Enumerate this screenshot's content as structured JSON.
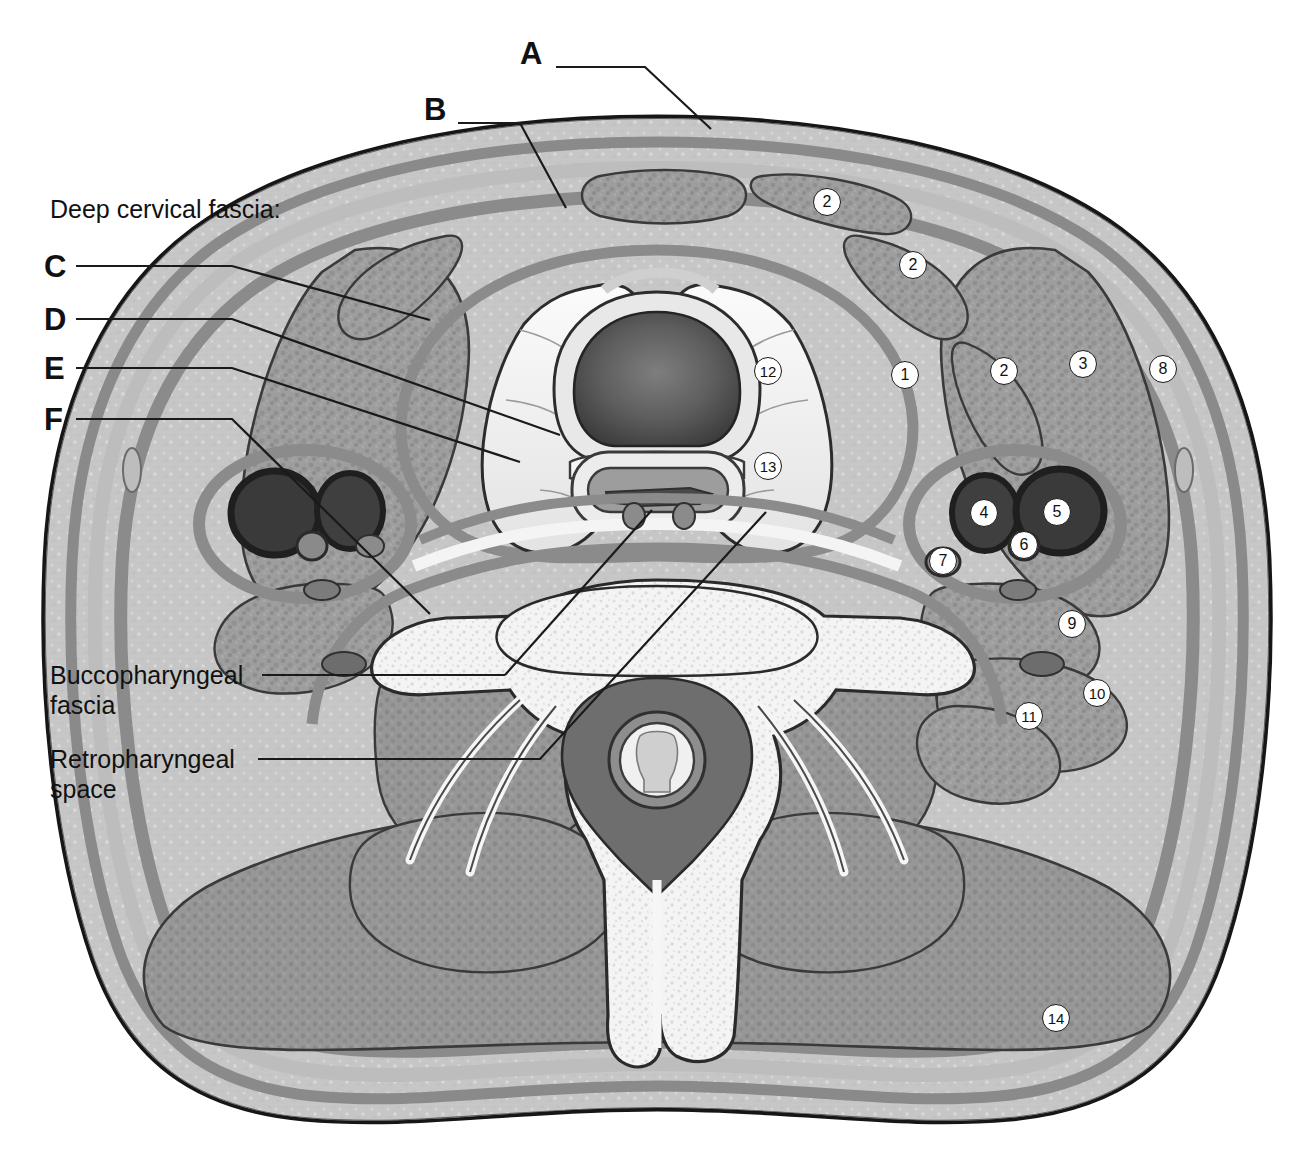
{
  "figure": {
    "view": "transverse section at level of thyroid gland / C6 vertebra"
  },
  "colors": {
    "outline": "#161616",
    "skin": "#c9c9c9",
    "subcutaneous": "#b9b9b9",
    "fascia": "#8d8d8d",
    "muscle": "#9b9b9b",
    "muscle_dark": "#8a8a8a",
    "bone": "#f2f2f2",
    "thyroid": "#efefef",
    "airway_dark": "#5a5a5a",
    "vessel_dark": "#4a4a4a",
    "fat_light": "#e6e6e6",
    "leader_line": "#1a1a1a",
    "text": "#111111"
  },
  "group_heading": {
    "label": "Deep cervical fascia:",
    "x": 50,
    "y": 208
  },
  "letter_callouts": [
    {
      "id": "A",
      "label": "A",
      "x": 520,
      "y": 52,
      "path": "M 556 67 L 645 67 L 711 129"
    },
    {
      "id": "B",
      "label": "B",
      "x": 424,
      "y": 108,
      "path": "M 458 123 L 520 123 L 566 208"
    },
    {
      "id": "C",
      "label": "C",
      "x": 44,
      "y": 250,
      "path": "M 76 266 L 232 266 L 430 320"
    },
    {
      "id": "D",
      "label": "D",
      "x": 44,
      "y": 303,
      "path": "M 76 319 L 232 319 L 482 405 L 560 435"
    },
    {
      "id": "E",
      "label": "E",
      "x": 44,
      "y": 352,
      "path": "M 76 368 L 232 368 L 520 462"
    },
    {
      "id": "F",
      "label": "F",
      "x": 44,
      "y": 403,
      "path": "M 76 419 L 232 419 L 430 614"
    }
  ],
  "text_callouts": [
    {
      "id": "buccopharyngeal",
      "lines": [
        "Buccopharyngeal",
        "fascia"
      ],
      "x": 50,
      "y": 660,
      "path": "M 258 675 L 690 675 L 690 510",
      "path_alt": "M 258 675 L 500 675"
    },
    {
      "id": "retropharyngeal",
      "lines": [
        "Retropharyngeal",
        "space"
      ],
      "x": 50,
      "y": 744,
      "path": "M 253 759 L 540 759 L 766 512"
    }
  ],
  "numbered_markers": [
    {
      "n": "1",
      "x": 905,
      "y": 375
    },
    {
      "n": "2",
      "x": 827,
      "y": 202
    },
    {
      "n": "2",
      "x": 913,
      "y": 265
    },
    {
      "n": "2",
      "x": 1004,
      "y": 371
    },
    {
      "n": "3",
      "x": 1083,
      "y": 364
    },
    {
      "n": "4",
      "x": 984,
      "y": 513
    },
    {
      "n": "5",
      "x": 1057,
      "y": 512
    },
    {
      "n": "6",
      "x": 1024,
      "y": 545
    },
    {
      "n": "7",
      "x": 943,
      "y": 561
    },
    {
      "n": "8",
      "x": 1163,
      "y": 369
    },
    {
      "n": "9",
      "x": 1072,
      "y": 624
    },
    {
      "n": "10",
      "x": 1097,
      "y": 693
    },
    {
      "n": "11",
      "x": 1029,
      "y": 716
    },
    {
      "n": "12",
      "x": 768,
      "y": 371
    },
    {
      "n": "13",
      "x": 768,
      "y": 466
    },
    {
      "n": "14",
      "x": 1056,
      "y": 1018
    }
  ]
}
